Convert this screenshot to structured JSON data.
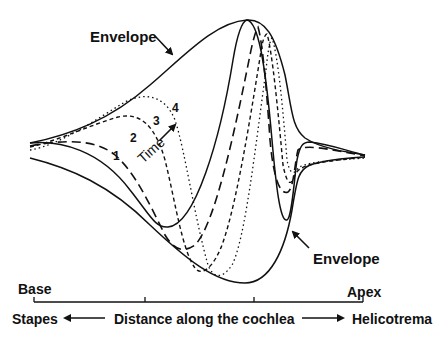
{
  "diagram": {
    "colors": {
      "ink": "#111111",
      "background": "#ffffff"
    },
    "annotations": {
      "envelope_top": "Envelope",
      "envelope_bottom": "Envelope",
      "time_label": "Time",
      "wave_numbers": [
        "1",
        "2",
        "3",
        "4"
      ]
    },
    "waves": [
      {
        "id": "1",
        "style": "solid"
      },
      {
        "id": "2",
        "style": "long-dash"
      },
      {
        "id": "3",
        "style": "short-dash"
      },
      {
        "id": "4",
        "style": "dotted"
      }
    ],
    "axis": {
      "left_end_label": "Base",
      "right_end_label": "Apex",
      "left_direction_label": "Stapes",
      "center_label": "Distance along the cochlea",
      "right_direction_label": "Helicotrema",
      "tick_count": 4
    }
  }
}
